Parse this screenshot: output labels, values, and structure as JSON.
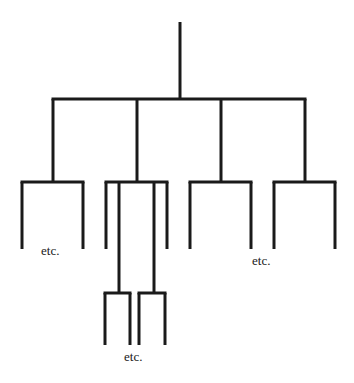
{
  "diagram": {
    "type": "tree",
    "line_color": "#1a1a1a",
    "background": "#ffffff",
    "labels": [
      {
        "id": "etc-1",
        "text": "etc.",
        "x": 41,
        "y": 244
      },
      {
        "id": "etc-2",
        "text": "etc.",
        "x": 252,
        "y": 254
      },
      {
        "id": "etc-3",
        "text": "etc.",
        "x": 124,
        "y": 350
      }
    ],
    "structure": {
      "root": {
        "stem": {
          "x": 180,
          "y1": 22,
          "y2": 99
        },
        "bar": {
          "y": 99,
          "x1": 53,
          "x2": 305
        },
        "children": [
          {
            "id": "branch-1",
            "drop": {
              "x": 53,
              "y1": 99,
              "y2": 182
            },
            "bar": {
              "y": 182,
              "x1": 22,
              "x2": 83
            },
            "legs": [
              {
                "x": 22,
                "y1": 182,
                "y2": 249
              },
              {
                "x": 83,
                "y1": 182,
                "y2": 249
              }
            ]
          },
          {
            "id": "branch-2",
            "drop": {
              "x": 137,
              "y1": 99,
              "y2": 182
            },
            "bar": {
              "y": 182,
              "x1": 106,
              "x2": 167
            },
            "legs": [
              {
                "x": 106,
                "y1": 182,
                "y2": 249
              },
              {
                "x": 167,
                "y1": 182,
                "y2": 249
              }
            ],
            "long_legs": [
              {
                "id": "branch-2a",
                "drop": {
                  "x": 119,
                  "y1": 182,
                  "y2": 293
                },
                "bar": {
                  "y": 293,
                  "x1": 105,
                  "x2": 130
                },
                "legs": [
                  {
                    "x": 105,
                    "y1": 293,
                    "y2": 345
                  },
                  {
                    "x": 130,
                    "y1": 293,
                    "y2": 345
                  }
                ]
              },
              {
                "id": "branch-2b",
                "drop": {
                  "x": 154,
                  "y1": 182,
                  "y2": 293
                },
                "bar": {
                  "y": 293,
                  "x1": 139,
                  "x2": 165
                },
                "legs": [
                  {
                    "x": 139,
                    "y1": 293,
                    "y2": 345
                  },
                  {
                    "x": 165,
                    "y1": 293,
                    "y2": 345
                  }
                ]
              }
            ]
          },
          {
            "id": "branch-3",
            "drop": {
              "x": 221,
              "y1": 99,
              "y2": 182
            },
            "bar": {
              "y": 182,
              "x1": 190,
              "x2": 251
            },
            "legs": [
              {
                "x": 190,
                "y1": 182,
                "y2": 249
              },
              {
                "x": 251,
                "y1": 182,
                "y2": 249
              }
            ]
          },
          {
            "id": "branch-4",
            "drop": {
              "x": 305,
              "y1": 99,
              "y2": 182
            },
            "bar": {
              "y": 182,
              "x1": 274,
              "x2": 335
            },
            "legs": [
              {
                "x": 274,
                "y1": 182,
                "y2": 249
              },
              {
                "x": 335,
                "y1": 182,
                "y2": 249
              }
            ]
          }
        ]
      }
    }
  }
}
